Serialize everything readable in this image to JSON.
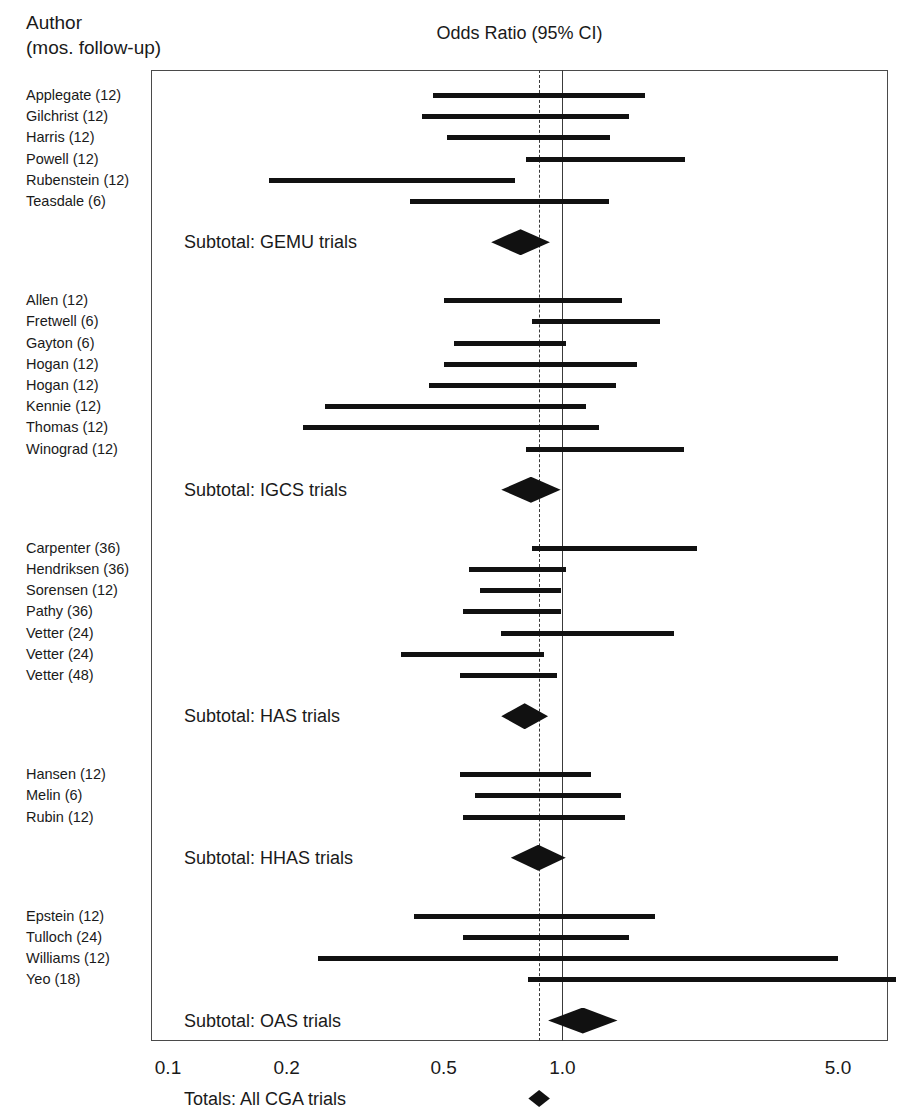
{
  "header": {
    "column_header_line1": "Author",
    "column_header_line2": "(mos. follow-up)",
    "plot_title": "Odds Ratio (95% CI)"
  },
  "axis": {
    "tick_labels": [
      "0.1",
      "0.2",
      "0.5",
      "1.0",
      "5.0"
    ],
    "tick_values": [
      0.1,
      0.2,
      0.5,
      1.0,
      5.0
    ],
    "scale": "log",
    "null_line_value": 1.0,
    "pooled_line_value": 0.87
  },
  "chart_data": {
    "type": "forest",
    "title": "Odds Ratio (95% CI)",
    "xlabel": "",
    "ylabel": "Author (mos. follow-up)",
    "xscale": "log",
    "xlim": [
      0.1,
      7.0
    ],
    "xticks": [
      0.1,
      0.2,
      0.5,
      1.0,
      5.0
    ],
    "xticklabels": [
      "0.1",
      "0.2",
      "0.5",
      "1.0",
      "5.0"
    ],
    "grid": false,
    "legend": "none",
    "reference_lines": [
      {
        "value": 1.0,
        "style": "solid",
        "label": "no effect"
      },
      {
        "value": 0.87,
        "style": "dashed",
        "label": "overall pooled estimate"
      }
    ],
    "groups": [
      {
        "name": "GEMU trials",
        "summary_label": "Subtotal: GEMU trials",
        "summary": {
          "or": 0.78,
          "ci_low": 0.66,
          "ci_high": 0.93
        },
        "studies": [
          {
            "label": "Applegate (12)",
            "author": "Applegate",
            "followup_months": 12,
            "or": 0.87,
            "ci_low": 0.47,
            "ci_high": 1.62
          },
          {
            "label": "Gilchrist (12)",
            "author": "Gilchrist",
            "followup_months": 12,
            "or": 0.8,
            "ci_low": 0.44,
            "ci_high": 1.48
          },
          {
            "label": "Harris (12)",
            "author": "Harris",
            "followup_months": 12,
            "or": 0.82,
            "ci_low": 0.51,
            "ci_high": 1.32
          },
          {
            "label": "Powell (12)",
            "author": "Powell",
            "followup_months": 12,
            "or": 1.28,
            "ci_low": 0.81,
            "ci_high": 2.05
          },
          {
            "label": "Rubenstein (12)",
            "author": "Rubenstein",
            "followup_months": 12,
            "or": 0.37,
            "ci_low": 0.18,
            "ci_high": 0.76
          },
          {
            "label": "Teasdale (6)",
            "author": "Teasdale",
            "followup_months": 6,
            "or": 0.73,
            "ci_low": 0.41,
            "ci_high": 1.31
          }
        ]
      },
      {
        "name": "IGCS trials",
        "summary_label": "Subtotal: IGCS trials",
        "summary": {
          "or": 0.83,
          "ci_low": 0.7,
          "ci_high": 0.99
        },
        "studies": [
          {
            "label": "Allen (12)",
            "author": "Allen",
            "followup_months": 12,
            "or": 0.84,
            "ci_low": 0.5,
            "ci_high": 1.42
          },
          {
            "label": "Fretwell (6)",
            "author": "Fretwell",
            "followup_months": 6,
            "or": 1.22,
            "ci_low": 0.84,
            "ci_high": 1.77
          },
          {
            "label": "Gayton (6)",
            "author": "Gayton",
            "followup_months": 6,
            "or": 0.74,
            "ci_low": 0.53,
            "ci_high": 1.02
          },
          {
            "label": "Hogan (12)",
            "author": "Hogan",
            "followup_months": 12,
            "or": 0.88,
            "ci_low": 0.5,
            "ci_high": 1.55
          },
          {
            "label": "Hogan (12)",
            "author": "Hogan",
            "followup_months": 12,
            "or": 0.8,
            "ci_low": 0.46,
            "ci_high": 1.37
          },
          {
            "label": "Kennie (12)",
            "author": "Kennie",
            "followup_months": 12,
            "or": 0.54,
            "ci_low": 0.25,
            "ci_high": 1.15
          },
          {
            "label": "Thomas (12)",
            "author": "Thomas",
            "followup_months": 12,
            "or": 0.52,
            "ci_low": 0.22,
            "ci_high": 1.24
          },
          {
            "label": "Winograd (12)",
            "author": "Winograd",
            "followup_months": 12,
            "or": 1.28,
            "ci_low": 0.81,
            "ci_high": 2.04
          }
        ]
      },
      {
        "name": "HAS trials",
        "summary_label": "Subtotal: HAS trials",
        "summary": {
          "or": 0.8,
          "ci_low": 0.7,
          "ci_high": 0.92
        },
        "studies": [
          {
            "label": "Carpenter (36)",
            "author": "Carpenter",
            "followup_months": 36,
            "or": 1.36,
            "ci_low": 0.84,
            "ci_high": 2.2
          },
          {
            "label": "Hendriksen (36)",
            "author": "Hendriksen",
            "followup_months": 36,
            "or": 0.76,
            "ci_low": 0.58,
            "ci_high": 1.02
          },
          {
            "label": "Sorensen (12)",
            "author": "Sorensen",
            "followup_months": 12,
            "or": 0.79,
            "ci_low": 0.62,
            "ci_high": 0.99
          },
          {
            "label": "Pathy (36)",
            "author": "Pathy",
            "followup_months": 36,
            "or": 0.74,
            "ci_low": 0.56,
            "ci_high": 0.99
          },
          {
            "label": "Vetter (24)",
            "author": "Vetter",
            "followup_months": 24,
            "or": 1.16,
            "ci_low": 0.7,
            "ci_high": 1.92
          },
          {
            "label": "Vetter (24)",
            "author": "Vetter",
            "followup_months": 24,
            "or": 0.6,
            "ci_low": 0.39,
            "ci_high": 0.9
          },
          {
            "label": "Vetter (48)",
            "author": "Vetter",
            "followup_months": 48,
            "or": 0.73,
            "ci_low": 0.55,
            "ci_high": 0.97
          }
        ]
      },
      {
        "name": "HHAS trials",
        "summary_label": "Subtotal: HHAS trials",
        "summary": {
          "or": 0.86,
          "ci_low": 0.74,
          "ci_high": 1.02
        },
        "studies": [
          {
            "label": "Hansen (12)",
            "author": "Hansen",
            "followup_months": 12,
            "or": 0.8,
            "ci_low": 0.55,
            "ci_high": 1.18
          },
          {
            "label": "Melin (6)",
            "author": "Melin",
            "followup_months": 6,
            "or": 0.92,
            "ci_low": 0.6,
            "ci_high": 1.41
          },
          {
            "label": "Rubin (12)",
            "author": "Rubin",
            "followup_months": 12,
            "or": 0.9,
            "ci_low": 0.56,
            "ci_high": 1.44
          }
        ]
      },
      {
        "name": "OAS trials",
        "summary_label": "Subtotal: OAS trials",
        "summary": {
          "or": 1.12,
          "ci_low": 0.92,
          "ci_high": 1.38
        },
        "studies": [
          {
            "label": "Epstein (12)",
            "author": "Epstein",
            "followup_months": 12,
            "or": 0.86,
            "ci_low": 0.42,
            "ci_high": 1.72
          },
          {
            "label": "Tulloch (24)",
            "author": "Tulloch",
            "followup_months": 24,
            "or": 0.92,
            "ci_low": 0.56,
            "ci_high": 1.48
          },
          {
            "label": "Williams (12)",
            "author": "Williams",
            "followup_months": 12,
            "or": 1.1,
            "ci_low": 0.24,
            "ci_high": 5.0
          },
          {
            "label": "Yeo (18)",
            "author": "Yeo",
            "followup_months": 18,
            "or": 2.3,
            "ci_low": 0.82,
            "ci_high": 7.0
          }
        ]
      }
    ],
    "total": {
      "label": "Totals: All CGA trials",
      "or": 0.87,
      "ci_low": 0.82,
      "ci_high": 0.93
    }
  },
  "colors": {
    "bar": "#111111",
    "diamond": "#111111",
    "frame": "#4a4a4a",
    "reference_line": "#3a3a3a",
    "text": "#1a1a1a"
  }
}
